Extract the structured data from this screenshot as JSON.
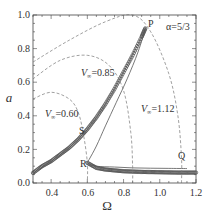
{
  "chart_data": {
    "type": "line",
    "title": "",
    "xlabel": "Ω",
    "ylabel": "a",
    "xlim": [
      0.3,
      1.2
    ],
    "ylim": [
      0.0,
      1.0
    ],
    "xticks": [
      0.4,
      0.6,
      0.8,
      1.0,
      1.2
    ],
    "xtick_labels": [
      "0.4",
      "0.6",
      "0.8",
      "1.0",
      "1.2"
    ],
    "yticks": [
      0.0,
      0.2,
      0.4,
      0.6,
      0.8,
      1.0
    ],
    "ytick_labels": [
      "0.0",
      "0.2",
      "0.4",
      "0.6",
      "0.8",
      "1.0"
    ],
    "grid": false,
    "legend": null,
    "parameter_label": "α=5/3",
    "series": [
      {
        "name": "upper branch (numerical, circles)",
        "style": "markers",
        "x": [
          0.3,
          0.35,
          0.4,
          0.45,
          0.5,
          0.55,
          0.6,
          0.65,
          0.7,
          0.75,
          0.8,
          0.85,
          0.9,
          0.92
        ],
        "y": [
          0.06,
          0.1,
          0.13,
          0.17,
          0.21,
          0.26,
          0.32,
          0.39,
          0.47,
          0.56,
          0.66,
          0.76,
          0.87,
          0.92
        ]
      },
      {
        "name": "analytic backbone (solid)",
        "style": "solid",
        "x": [
          0.3,
          0.4,
          0.5,
          0.6,
          0.7,
          0.8,
          0.9,
          0.92,
          0.88,
          0.82,
          0.76,
          0.7,
          0.65,
          0.61,
          0.6,
          0.65,
          0.75,
          0.85,
          0.95,
          1.05,
          1.15
        ],
        "y": [
          0.06,
          0.13,
          0.21,
          0.32,
          0.47,
          0.66,
          0.87,
          0.92,
          0.78,
          0.62,
          0.48,
          0.34,
          0.22,
          0.14,
          0.12,
          0.1,
          0.095,
          0.09,
          0.088,
          0.087,
          0.086
        ]
      },
      {
        "name": "lower branch (numerical, circles)",
        "style": "markers",
        "x": [
          0.6,
          0.65,
          0.7,
          0.75,
          0.8,
          0.85,
          0.9,
          0.95,
          1.0,
          1.05,
          1.1,
          1.15,
          1.2
        ],
        "y": [
          0.12,
          0.09,
          0.08,
          0.075,
          0.07,
          0.068,
          0.066,
          0.065,
          0.064,
          0.063,
          0.062,
          0.062,
          0.062
        ]
      },
      {
        "name": "V∞=0.60",
        "style": "dashed",
        "x": [
          0.3,
          0.4,
          0.5,
          0.55,
          0.58,
          0.6,
          0.6
        ],
        "y": [
          0.5,
          0.54,
          0.5,
          0.42,
          0.28,
          0.12,
          0.0
        ]
      },
      {
        "name": "V∞=0.85",
        "style": "dashed",
        "x": [
          0.3,
          0.45,
          0.6,
          0.72,
          0.8,
          0.84,
          0.85,
          0.85
        ],
        "y": [
          0.62,
          0.73,
          0.76,
          0.7,
          0.55,
          0.3,
          0.1,
          0.0
        ]
      },
      {
        "name": "V∞=1.12",
        "style": "dashed",
        "x": [
          0.3,
          0.5,
          0.7,
          0.85,
          0.95,
          1.05,
          1.1,
          1.12,
          1.12
        ],
        "y": [
          0.72,
          0.85,
          0.96,
          1.0,
          0.9,
          0.65,
          0.4,
          0.15,
          0.0
        ]
      }
    ],
    "annotations": [
      {
        "text": "P",
        "x": 0.93,
        "y": 0.93
      },
      {
        "text": "S",
        "x": 0.55,
        "y": 0.3
      },
      {
        "text": "R",
        "x": 0.56,
        "y": 0.11
      },
      {
        "text": "Q",
        "x": 1.14,
        "y": 0.15
      },
      {
        "text": "V∞=0.60",
        "x": 0.33,
        "y": 0.41
      },
      {
        "text": "V∞=0.85",
        "x": 0.56,
        "y": 0.66
      },
      {
        "text": "V∞=1.12",
        "x": 0.99,
        "y": 0.42
      },
      {
        "text": "α=5/3",
        "x": 1.05,
        "y": 0.93
      }
    ]
  },
  "labels": {
    "x_axis_title": "Ω",
    "y_axis_title": "a",
    "alpha": "α=5/3",
    "point_P": "P",
    "point_S": "S",
    "point_R": "R",
    "point_Q": "Q",
    "v060_prefix": "V",
    "v060_sub": "∞",
    "v060_value": "=0.60",
    "v085_prefix": "V",
    "v085_sub": "∞",
    "v085_value": "=0.85",
    "v112_prefix": "V",
    "v112_sub": "∞",
    "v112_value": "=1.12",
    "xtick": [
      "0.4",
      "0.6",
      "0.8",
      "1.0",
      "1.2"
    ],
    "ytick": [
      "0.0",
      "0.2",
      "0.4",
      "0.6",
      "0.8",
      "1.0"
    ]
  }
}
